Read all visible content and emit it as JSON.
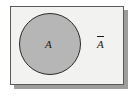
{
  "figure": {
    "type": "venn-diagram",
    "universe": {
      "name": "universal-set-box",
      "fill_color": "#f2f2f0",
      "border_color": "#5a5a5a",
      "shadow_color": "#9d9d9d"
    },
    "set": {
      "label": "A",
      "fill_color": "#b6b6b6",
      "border_color": "#2b2b2b"
    },
    "complement": {
      "label": "A",
      "overbar": true,
      "fill_color": "#f2f2f0"
    }
  }
}
